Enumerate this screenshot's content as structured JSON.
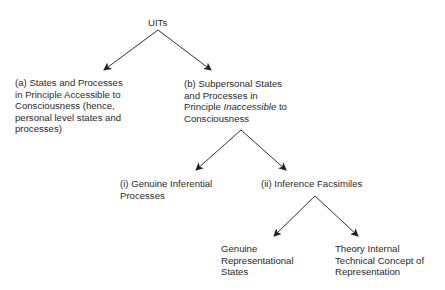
{
  "diagram": {
    "type": "tree",
    "root": {
      "label": "UITs"
    },
    "nodes": {
      "a": {
        "lines": [
          "(a) States and Processes",
          "in Principle Accessible to",
          "Consciousness (hence,",
          "personal level states and",
          "processes)"
        ]
      },
      "b": {
        "line1": "(b) Subpersonal States",
        "line2": "and Processes in",
        "line3_pre": "Principle ",
        "line3_em": "Inaccessible",
        "line3_post": " to",
        "line4": "Consciousness"
      },
      "i": {
        "lines": [
          "(i) Genuine Inferential",
          "Processes"
        ]
      },
      "ii": {
        "lines": [
          "(ii) Inference Facsimiles"
        ]
      },
      "genuine": {
        "lines": [
          "Genuine",
          "Representational",
          "States"
        ]
      },
      "theory": {
        "lines": [
          "Theory Internal",
          "Technical Concept of",
          "Representation"
        ]
      }
    },
    "edges": [
      {
        "from": "UITs",
        "to": "(a)"
      },
      {
        "from": "UITs",
        "to": "(b)"
      },
      {
        "from": "(b)",
        "to": "(i)"
      },
      {
        "from": "(b)",
        "to": "(ii)"
      },
      {
        "from": "(ii)",
        "to": "Genuine Representational States"
      },
      {
        "from": "(ii)",
        "to": "Theory Internal Technical Concept of Representation"
      }
    ],
    "colors": {
      "line": "#333333",
      "text": "#2a2a2a",
      "background": "#ffffff"
    }
  }
}
